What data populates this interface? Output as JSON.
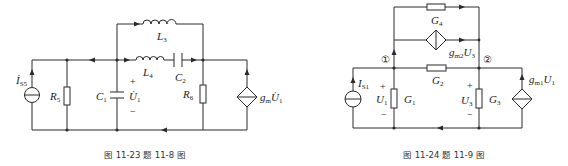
{
  "figures": [
    {
      "id": "fig-11-23",
      "caption": "图 11-23   题 11-8 图",
      "labels": {
        "iss": "İ",
        "iss_sub": "S5",
        "r5": "R",
        "r5_sub": "5",
        "c1": "C",
        "c1_sub": "1",
        "u1": "U̇",
        "u1_sub": "1",
        "l3": "L",
        "l3_sub": "3",
        "l4": "L",
        "l4_sub": "4",
        "c2": "C",
        "c2_sub": "2",
        "r6": "R",
        "r6_sub": "6",
        "gm": "g",
        "gm_sub": "m",
        "gm_u": "U̇",
        "gm_u_sub": "1",
        "plus": "+",
        "minus": "−"
      }
    },
    {
      "id": "fig-11-24",
      "caption": "图 11-24   题 11-9 图",
      "labels": {
        "node1": "①",
        "node2": "②",
        "is1": "I",
        "is1_sub": "S1",
        "u1": "U",
        "u1_sub": "1",
        "g1": "G",
        "g1_sub": "1",
        "g2": "G",
        "g2_sub": "2",
        "g3": "G",
        "g3_sub": "3",
        "g4": "G",
        "g4_sub": "4",
        "u3": "U",
        "u3_sub": "3",
        "gm2": "g",
        "gm2_sub": "m2",
        "gm2_u": "U",
        "gm2_u_sub": "3",
        "gm1": "g",
        "gm1_sub": "m1",
        "gm1_u": "U",
        "gm1_u_sub": "1",
        "plus": "+",
        "minus": "−"
      }
    }
  ]
}
